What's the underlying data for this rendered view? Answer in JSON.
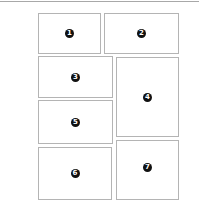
{
  "layout": {
    "title": "",
    "panels": [
      {
        "label": "1",
        "left": 38,
        "top": 13,
        "width": 63,
        "height": 41
      },
      {
        "label": "2",
        "left": 104,
        "top": 13,
        "width": 75,
        "height": 41
      },
      {
        "label": "3",
        "left": 38,
        "top": 56,
        "width": 75,
        "height": 42
      },
      {
        "label": "4",
        "left": 116,
        "top": 57,
        "width": 63,
        "height": 80
      },
      {
        "label": "5",
        "left": 38,
        "top": 100,
        "width": 75,
        "height": 44
      },
      {
        "label": "6",
        "left": 38,
        "top": 147,
        "width": 74,
        "height": 53
      },
      {
        "label": "7",
        "left": 116,
        "top": 140,
        "width": 63,
        "height": 60
      }
    ]
  },
  "colors": {
    "border": "#b4b4b4",
    "badge_bg": "#111111",
    "badge_text": "#ffffff",
    "top_rule": "#a8a8a8"
  }
}
